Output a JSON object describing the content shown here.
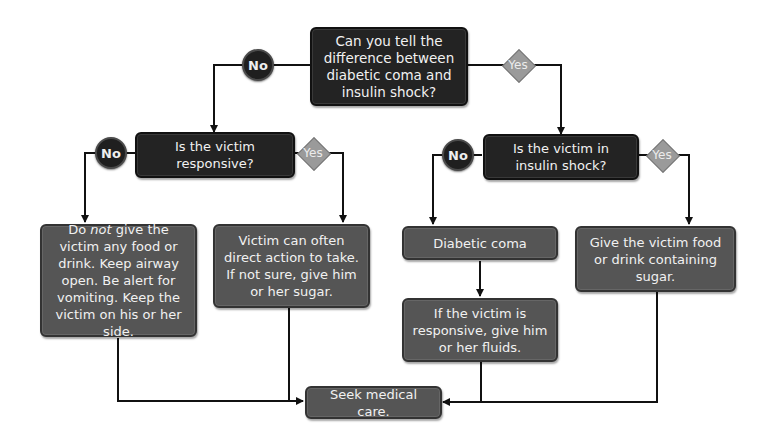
{
  "diagram": {
    "nodes": {
      "q1": "Can you tell the difference between diabetic coma and insulin shock?",
      "q2": "Is the victim responsive?",
      "q3": "Is the victim in insulin shock?",
      "a1_prefix": "Do ",
      "a1_em": "not",
      "a1_rest": " give the victim any food or drink. Keep airway open. Be alert for vomiting. Keep the victim on his or her side.",
      "a2": "Victim can often direct action to take. If not sure, give him or her sugar.",
      "a3": "Diabetic coma",
      "a4": "Give the victim food or drink containing sugar.",
      "a5": "If the victim is responsive, give him or her fluids.",
      "end": "Seek medical care."
    },
    "labels": {
      "no": "No",
      "yes": "Yes"
    },
    "colors": {
      "question_box": "#232323",
      "action_box": "#555555",
      "yes_diamond": "#9a9a9a",
      "no_circle": "#1f1f1f",
      "connector": "#111111"
    }
  }
}
